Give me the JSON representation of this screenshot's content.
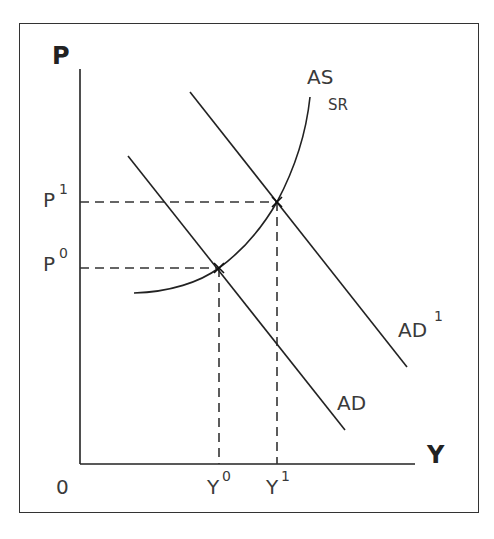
{
  "diagram": {
    "type": "economics AS-AD diagram",
    "axes": {
      "y_label": "P",
      "x_label": "Y",
      "origin_label": "0"
    },
    "price_levels": [
      {
        "base": "P",
        "sup": "1",
        "y": 202
      },
      {
        "base": "P",
        "sup": "0",
        "y": 268
      }
    ],
    "output_levels": [
      {
        "base": "Y",
        "sup": "0",
        "x": 219
      },
      {
        "base": "Y",
        "sup": "1",
        "x": 277
      }
    ],
    "curves": {
      "as": {
        "label": "AS",
        "sub": "SR"
      },
      "ad": {
        "label": "AD"
      },
      "ad1": {
        "label": "AD",
        "sup": "1"
      }
    },
    "colors": {
      "line": "#222222",
      "dash": "#333333",
      "text": "#3a3a3a"
    }
  }
}
